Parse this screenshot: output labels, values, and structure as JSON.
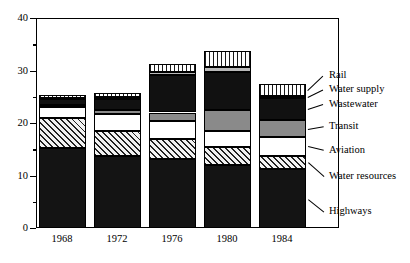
{
  "chart_data": {
    "type": "bar",
    "subtype": "stacked-bar",
    "title": "",
    "xlabel": "",
    "ylabel": "",
    "categories": [
      "1968",
      "1972",
      "1976",
      "1980",
      "1984"
    ],
    "ylim": [
      0,
      40
    ],
    "yticks": [
      0,
      10,
      20,
      30,
      40
    ],
    "ytick_labels": [
      "0",
      "10",
      "20",
      "30",
      "40"
    ],
    "yminor_ticks": [
      5,
      15,
      25,
      35
    ],
    "grid": false,
    "legend_position": "right",
    "stack_order_bottom_to_top": [
      "Highways",
      "Water resources",
      "Aviation",
      "Transit",
      "Wastewater",
      "Water supply",
      "Rail"
    ],
    "series": [
      {
        "name": "Highways",
        "pattern": "solid-black",
        "values": [
          15.3,
          13.7,
          13.1,
          12.0,
          11.2
        ]
      },
      {
        "name": "Water resources",
        "pattern": "diagonal-hatch",
        "values": [
          5.7,
          4.8,
          3.9,
          3.5,
          2.6
        ]
      },
      {
        "name": "Aviation",
        "pattern": "white",
        "values": [
          2.0,
          3.3,
          3.3,
          3.0,
          3.5
        ]
      },
      {
        "name": "Transit",
        "pattern": "solid-gray",
        "values": [
          0.4,
          0.6,
          1.7,
          4.0,
          3.2
        ]
      },
      {
        "name": "Wastewater",
        "pattern": "solid-black",
        "values": [
          1.1,
          2.1,
          7.1,
          7.2,
          4.3
        ]
      },
      {
        "name": "Water supply",
        "pattern": "light-gray",
        "values": [
          0.3,
          0.4,
          0.6,
          1.0,
          0.4
        ]
      },
      {
        "name": "Rail",
        "pattern": "vertical-stripes",
        "values": [
          0.5,
          0.8,
          1.6,
          3.0,
          2.3
        ]
      }
    ],
    "totals": [
      25.3,
      25.7,
      31.3,
      33.7,
      27.5
    ]
  },
  "legend": {
    "items": [
      {
        "label": "Rail"
      },
      {
        "label": "Water supply"
      },
      {
        "label": "Wastewater"
      },
      {
        "label": "Transit"
      },
      {
        "label": "Aviation"
      },
      {
        "label": "Water resources"
      },
      {
        "label": "Highways"
      }
    ]
  },
  "colors": {
    "axis": "#000000",
    "background": "#ffffff",
    "highways": "#141414",
    "water_resources": "#f2f2f2",
    "aviation": "#ffffff",
    "transit": "#8a8a8a",
    "wastewater": "#111111",
    "water_supply": "#b9b9b9",
    "rail": "#ffffff"
  }
}
